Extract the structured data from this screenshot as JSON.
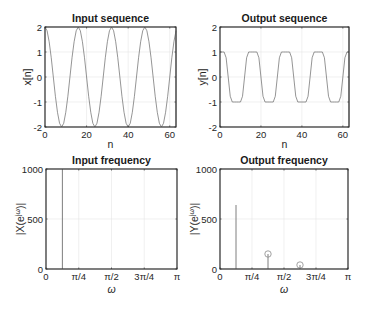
{
  "figure": {
    "panels": [
      {
        "id": "input-sequence",
        "title": "Input sequence"
      },
      {
        "id": "output-sequence",
        "title": "Output sequence"
      },
      {
        "id": "input-frequency",
        "title": "Input frequency"
      },
      {
        "id": "output-frequency",
        "title": "Output frequency"
      }
    ]
  },
  "colors": {
    "series": "#7a7a7a",
    "axes": "#262626",
    "grid": "#e6e6e6",
    "background": "#ffffff"
  },
  "chart_data": [
    {
      "type": "line",
      "title": "Input sequence",
      "xlabel": "n",
      "ylabel": "x[n]",
      "xlim": [
        0,
        63
      ],
      "ylim": [
        -2,
        2
      ],
      "xticks": [
        0,
        20,
        40,
        60
      ],
      "xtick_labels": [
        "0",
        "20",
        "40",
        "60"
      ],
      "yticks": [
        -2,
        -1,
        0,
        1,
        2
      ],
      "ytick_labels": [
        "-2",
        "-1",
        "0",
        "1",
        "2"
      ],
      "grid": true,
      "formula": "x[n] = 2cos(pi*n/8), n = 0..63",
      "x": [
        0,
        1,
        2,
        3,
        4,
        5,
        6,
        7,
        8,
        9,
        10,
        11,
        12,
        13,
        14,
        15,
        16,
        17,
        18,
        19,
        20,
        21,
        22,
        23,
        24,
        25,
        26,
        27,
        28,
        29,
        30,
        31,
        32,
        33,
        34,
        35,
        36,
        37,
        38,
        39,
        40,
        41,
        42,
        43,
        44,
        45,
        46,
        47,
        48,
        49,
        50,
        51,
        52,
        53,
        54,
        55,
        56,
        57,
        58,
        59,
        60,
        61,
        62,
        63
      ],
      "values": [
        2,
        1.85,
        1.41,
        0.77,
        0,
        -0.77,
        -1.41,
        -1.85,
        -2,
        -1.85,
        -1.41,
        -0.77,
        0,
        0.77,
        1.41,
        1.85,
        2,
        1.85,
        1.41,
        0.77,
        0,
        -0.77,
        -1.41,
        -1.85,
        -2,
        -1.85,
        -1.41,
        -0.77,
        0,
        0.77,
        1.41,
        1.85,
        2,
        1.85,
        1.41,
        0.77,
        0,
        -0.77,
        -1.41,
        -1.85,
        -2,
        -1.85,
        -1.41,
        -0.77,
        0,
        0.77,
        1.41,
        1.85,
        2,
        1.85,
        1.41,
        0.77,
        0,
        -0.77,
        -1.41,
        -1.85,
        -2,
        -1.85,
        -1.41,
        -0.77,
        0,
        0.77,
        1.41,
        1.85
      ]
    },
    {
      "type": "line",
      "title": "Output sequence",
      "xlabel": "n",
      "ylabel": "y[n]",
      "xlim": [
        0,
        63
      ],
      "ylim": [
        -2,
        2
      ],
      "xticks": [
        0,
        20,
        40,
        60
      ],
      "xtick_labels": [
        "0",
        "20",
        "40",
        "60"
      ],
      "yticks": [
        -2,
        -1,
        0,
        1,
        2
      ],
      "ytick_labels": [
        "-2",
        "-1",
        "0",
        "1",
        "2"
      ],
      "grid": true,
      "formula": "y[n] = clip(x[n], -1, 1)",
      "x": [
        0,
        1,
        2,
        3,
        4,
        5,
        6,
        7,
        8,
        9,
        10,
        11,
        12,
        13,
        14,
        15,
        16,
        17,
        18,
        19,
        20,
        21,
        22,
        23,
        24,
        25,
        26,
        27,
        28,
        29,
        30,
        31,
        32,
        33,
        34,
        35,
        36,
        37,
        38,
        39,
        40,
        41,
        42,
        43,
        44,
        45,
        46,
        47,
        48,
        49,
        50,
        51,
        52,
        53,
        54,
        55,
        56,
        57,
        58,
        59,
        60,
        61,
        62,
        63
      ],
      "values": [
        1,
        1,
        1,
        0.77,
        0,
        -0.77,
        -1,
        -1,
        -1,
        -1,
        -1,
        -0.77,
        0,
        0.77,
        1,
        1,
        1,
        1,
        1,
        0.77,
        0,
        -0.77,
        -1,
        -1,
        -1,
        -1,
        -1,
        -0.77,
        0,
        0.77,
        1,
        1,
        1,
        1,
        1,
        0.77,
        0,
        -0.77,
        -1,
        -1,
        -1,
        -1,
        -1,
        -0.77,
        0,
        0.77,
        1,
        1,
        1,
        1,
        1,
        0.77,
        0,
        -0.77,
        -1,
        -1,
        -1,
        -1,
        -1,
        -0.77,
        0,
        0.77,
        1,
        1
      ]
    },
    {
      "type": "stem",
      "title": "Input frequency",
      "xlabel": "ω",
      "ylabel": "|X(e^{jω})|",
      "xlim": [
        0,
        3.1416
      ],
      "ylim": [
        0,
        1000
      ],
      "xticks": [
        0,
        0.7854,
        1.5708,
        2.3562,
        3.1416
      ],
      "xtick_labels": [
        "0",
        "π/4",
        "π/2",
        "3π/4",
        "π"
      ],
      "yticks": [
        0,
        500,
        1000
      ],
      "ytick_labels": [
        "0",
        "500",
        "1000"
      ],
      "grid": true,
      "points": [
        {
          "label": "π/8",
          "x": 0.3927,
          "y": 1000,
          "marker": false
        }
      ]
    },
    {
      "type": "stem",
      "title": "Output frequency",
      "xlabel": "ω",
      "ylabel": "|Y(e^{jω})|",
      "xlim": [
        0,
        3.1416
      ],
      "ylim": [
        0,
        1000
      ],
      "xticks": [
        0,
        0.7854,
        1.5708,
        2.3562,
        3.1416
      ],
      "xtick_labels": [
        "0",
        "π/4",
        "π/2",
        "3π/4",
        "π"
      ],
      "yticks": [
        0,
        500,
        1000
      ],
      "ytick_labels": [
        "0",
        "500",
        "1000"
      ],
      "grid": true,
      "points": [
        {
          "label": "π/8",
          "x": 0.3927,
          "y": 640,
          "marker": false
        },
        {
          "label": "3π/8",
          "x": 1.1781,
          "y": 150,
          "marker": true
        },
        {
          "label": "5π/8",
          "x": 1.9635,
          "y": 40,
          "marker": true
        }
      ]
    }
  ]
}
